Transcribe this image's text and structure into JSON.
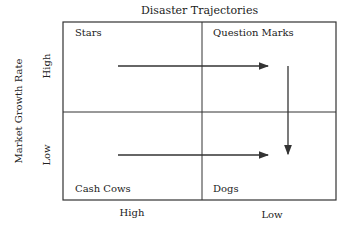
{
  "title": "Disaster Trajectories",
  "axes": {
    "y_label": "Market Growth Rate",
    "y_ticks": [
      "High",
      "Low"
    ],
    "x_ticks": [
      "High",
      "Low"
    ]
  },
  "quadrants": {
    "top_left": "Stars",
    "top_right": "Question Marks",
    "bottom_left": "Cash Cows",
    "bottom_right": "Dogs"
  },
  "arrows": [
    {
      "from": "Stars",
      "to": "Question Marks",
      "direction": "right"
    },
    {
      "from": "Question Marks",
      "to": "Dogs",
      "direction": "down"
    },
    {
      "from": "Cash Cows",
      "to": "Dogs",
      "direction": "right"
    }
  ],
  "colors": {
    "line": "#333333"
  }
}
